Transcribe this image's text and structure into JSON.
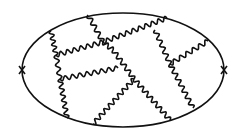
{
  "diagram": {
    "type": "feynman-vacuum-bubble",
    "background": "#ffffff",
    "stroke": "#111111",
    "fermion_loop": {
      "cx": 123,
      "cy": 70,
      "rx": 101,
      "ry": 57
    },
    "insertions": [
      {
        "name": "left-cross",
        "x": 22,
        "y": 70
      },
      {
        "name": "right-cross",
        "x": 224,
        "y": 70
      }
    ],
    "photons": [
      {
        "from": [
          51,
          31
        ],
        "to": [
          56,
          55
        ]
      },
      {
        "from": [
          56,
          55
        ],
        "to": [
          60,
          79
        ]
      },
      {
        "from": [
          60,
          79
        ],
        "to": [
          67,
          118
        ]
      },
      {
        "from": [
          88,
          15
        ],
        "to": [
          103,
          42
        ]
      },
      {
        "from": [
          56,
          55
        ],
        "to": [
          103,
          42
        ]
      },
      {
        "from": [
          103,
          42
        ],
        "to": [
          167,
          18
        ]
      },
      {
        "from": [
          103,
          42
        ],
        "to": [
          113,
          50
        ]
      },
      {
        "from": [
          113,
          50
        ],
        "to": [
          134,
          79
        ]
      },
      {
        "from": [
          60,
          79
        ],
        "to": [
          118,
          68
        ]
      },
      {
        "from": [
          134,
          79
        ],
        "to": [
          93,
          124
        ]
      },
      {
        "from": [
          134,
          79
        ],
        "to": [
          170,
          120
        ]
      },
      {
        "from": [
          155,
          30
        ],
        "to": [
          170,
          64
        ]
      },
      {
        "from": [
          170,
          64
        ],
        "to": [
          208,
          41
        ]
      },
      {
        "from": [
          170,
          64
        ],
        "to": [
          193,
          108
        ]
      }
    ]
  }
}
